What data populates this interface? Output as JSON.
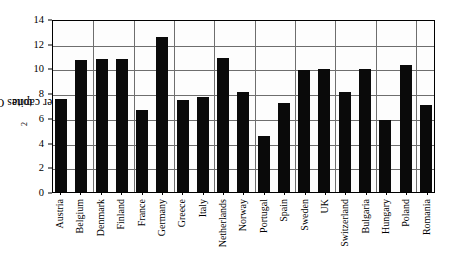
{
  "chart_data": {
    "type": "bar",
    "title": "",
    "xlabel": "",
    "ylabel": "tones CO2 per capita",
    "ylabel_parts": {
      "pre": "tones CO",
      "sub": "2",
      "post": " per capita"
    },
    "ylim": [
      0,
      14
    ],
    "yticks": [
      0,
      2,
      4,
      6,
      8,
      10,
      12,
      14
    ],
    "ytick_labels": [
      "0",
      "2",
      "4",
      "6",
      "8",
      "10",
      "12",
      "14"
    ],
    "grid": true,
    "legend": "none",
    "bar_color": "#0a0a0a",
    "categories": [
      "Austria",
      "Belgium",
      "Denmark",
      "Finland",
      "France",
      "Germany",
      "Greece",
      "Italy",
      "Netherlands",
      "Norway",
      "Portugal",
      "Spain",
      "Sweden",
      "UK",
      "Switzerland",
      "Bulgaria",
      "Hungary",
      "Poland",
      "Romania"
    ],
    "values": [
      7.6,
      10.8,
      10.9,
      10.9,
      6.7,
      12.7,
      7.5,
      7.8,
      11.0,
      8.2,
      4.6,
      7.3,
      10.0,
      10.1,
      8.2,
      10.1,
      5.9,
      10.4,
      7.1
    ]
  }
}
